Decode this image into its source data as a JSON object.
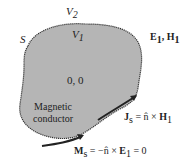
{
  "diagram": {
    "region_outer": "V",
    "region_outer_sub": "2",
    "region_inner": "V",
    "region_inner_sub": "1",
    "surface": "S",
    "fields_E": "E",
    "fields_E_sub": "1",
    "fields_sep": ", ",
    "fields_H": "H",
    "fields_H_sub": "1",
    "interior_fields": "0, 0",
    "material_line1": "Magnetic",
    "material_line2": "conductor",
    "Js_lhs": "J",
    "Js_lhs_sub": "s",
    "Js_rhs": " = n̂ × ",
    "Js_H": "H",
    "Js_H_sub": "1",
    "Ms_lhs": "M",
    "Ms_lhs_sub": "s",
    "Ms_rhs": " = −n̂ × ",
    "Ms_E": "E",
    "Ms_E_sub": "1",
    "Ms_tail": " = 0",
    "colors": {
      "fill": "#b5b5b5",
      "stroke": "#333333",
      "text": "#222222"
    }
  }
}
